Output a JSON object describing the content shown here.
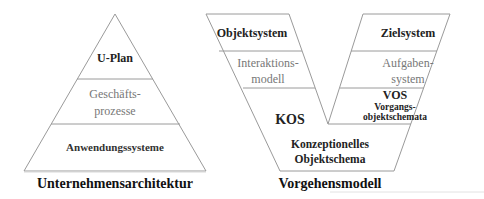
{
  "colors": {
    "outline": "#9a9a9a",
    "text_dark": "#222222",
    "text_grey": "#777777"
  },
  "pyramid": {
    "title": "Unternehmensarchitektur",
    "layers": [
      {
        "label": "U-Plan"
      },
      {
        "line1": "Geschäfts-",
        "line2": "prozesse"
      },
      {
        "label": "Anwendungssysteme"
      }
    ]
  },
  "vmodel": {
    "title": "Vorgehensmodell",
    "left_arm": {
      "objektsystem": "Objektsystem",
      "interaktion_line1": "Interaktions-",
      "interaktion_line2": "modell"
    },
    "right_arm": {
      "zielsystem": "Zielsystem",
      "aufgaben_line1": "Aufgaben-",
      "aufgaben_line2": "system",
      "vos": "VOS",
      "vos_line1": "Vorgangs-",
      "vos_line2": "objektschemata"
    },
    "base": {
      "kos": "KOS",
      "kos_line1": "Konzeptionelles",
      "kos_line2": "Objektschema"
    }
  }
}
